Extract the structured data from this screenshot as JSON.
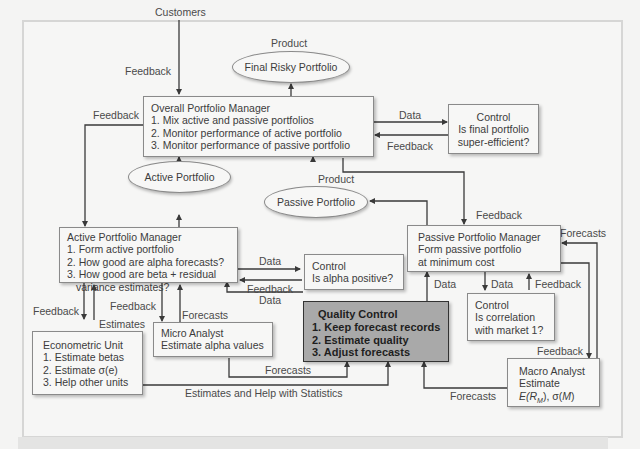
{
  "diagram": {
    "nodes": {
      "customers": "Customers",
      "final_risky_portfolio": "Final Risky Portfolio",
      "overall_pm": {
        "title": "Overall Portfolio Manager",
        "items": [
          "1. Mix active and passive portfolios",
          "2. Monitor performance of active portfolio",
          "3. Monitor performance of passive portfolio"
        ]
      },
      "control_super_efficient": {
        "title": "Control",
        "lines": [
          "Is final portfolio",
          "super-efficient?"
        ]
      },
      "active_portfolio": "Active Portfolio",
      "passive_portfolio": "Passive Portfolio",
      "active_pm": {
        "title": "Active Portfolio Manager",
        "items": [
          "1. Form active portfolio",
          "2. How good are alpha forecasts?",
          "3. How good are beta + residual",
          "variance estimates?"
        ]
      },
      "control_alpha": {
        "title": "Control",
        "lines": [
          "Is alpha positive?"
        ]
      },
      "passive_pm": {
        "title": "Passive Portfolio Manager",
        "lines": [
          "Form passive portfolio",
          "at minimum  cost"
        ]
      },
      "quality_control": {
        "title": "Quality Control",
        "items": [
          "1. Keep forecast records",
          "2. Estimate quality",
          "3. Adjust forecasts"
        ]
      },
      "control_correlation": {
        "title": "Control",
        "lines": [
          "Is correlation",
          "with market 1?"
        ]
      },
      "micro_analyst": {
        "title": "Micro Analyst",
        "lines": [
          "Estimate alpha values"
        ]
      },
      "econometric_unit": {
        "title": "Econometric Unit",
        "items": [
          "1. Estimate betas",
          "2. Estimate σ(e)",
          "3. Help other units"
        ]
      },
      "macro_analyst": {
        "title": "Macro Analyst",
        "lines": [
          "Estimate"
        ],
        "formula": {
          "e": "E(R",
          "sub": "M",
          "rest": "), σ(",
          "m": "M",
          "close": ")"
        }
      }
    },
    "edge_labels": {
      "product_final": "Product",
      "feedback_customers": "Feedback",
      "feedback_overall_left": "Feedback",
      "data_overall_control": "Data",
      "feedback_control_overall": "Feedback",
      "product_active": "Product",
      "product_passive": "Product",
      "feedback_passive_pm": "Feedback",
      "forecasts_passive_pm": "Forecasts",
      "data_active_control": "Data",
      "feedback_control_active": "Feedback",
      "data_qc_active": "Data",
      "data_qc_passive": "Data",
      "data_passive_correlation": "Data",
      "feedback_correlation_passive": "Feedback",
      "feedback_econometric": "Feedback",
      "estimates_econometric": "Estimates",
      "feedback_micro": "Feedback",
      "forecasts_micro": "Forecasts",
      "forecasts_micro_qc": "Forecasts",
      "estimates_help_stats": "Estimates and Help with Statistics",
      "feedback_macro": "Feedback",
      "forecasts_macro_qc": "Forecasts"
    },
    "colors": {
      "box_fill": "#f7f7f6",
      "qc_fill": "#a9a9a9",
      "line": "#3a3a3a",
      "background": "#f4f4f3"
    }
  }
}
